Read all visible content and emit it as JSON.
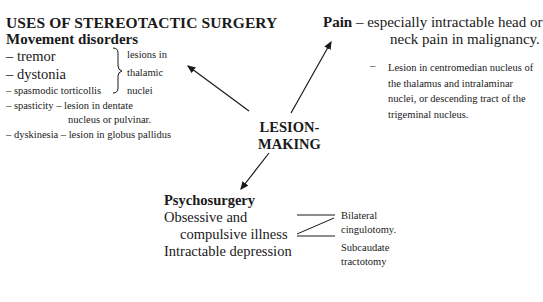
{
  "title": "USES OF STEREOTACTIC SURGERY",
  "movement": {
    "heading": "Movement disorders",
    "items": [
      {
        "text": "– tremor"
      },
      {
        "text": "– dystonia"
      },
      {
        "text": "– spasmodic torticollis"
      }
    ],
    "brace_note": [
      "lesions in",
      "thalamic",
      "nuclei"
    ],
    "spasticity": [
      "– spasticity – lesion in dentate",
      "nucleus or pulvinar."
    ],
    "dyskinesia": "– dyskinesia – lesion in globus pallidus"
  },
  "pain": {
    "heading": "Pain",
    "dash": "–",
    "line1": "especially intractable head or",
    "line2": "neck pain in malignancy.",
    "detail_dash": "–",
    "detail": "Lesion in centromedian nucleus of the thalamus and intralaminar nuclei, or descending tract of the trigeminal nucleus."
  },
  "center": {
    "line1": "LESION-",
    "line2": "MAKING"
  },
  "psychosurgery": {
    "heading": "Psychosurgery",
    "line1": "Obsessive and",
    "line2": "compulsive illness",
    "line3": "Intractable depression",
    "treatments": [
      {
        "line1": "Bilateral",
        "line2": "cingulotomy."
      },
      {
        "line1": "Subcaudate",
        "line2": "tractotomy"
      }
    ]
  }
}
